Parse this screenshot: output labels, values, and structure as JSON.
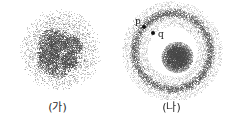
{
  "figure": {
    "width": 229,
    "height": 131,
    "background_color": "#ffffff",
    "ink_color": "#555555",
    "panels": [
      {
        "id": "panel-a",
        "caption": "(가)",
        "description": "uniform stippled disc with irregular dense core",
        "markers": []
      },
      {
        "id": "panel-b",
        "caption": "(나)",
        "description": "stippled annulus ring with dense central blob",
        "markers": [
          {
            "label": "p",
            "x": 144,
            "y": 27
          },
          {
            "label": "q",
            "x": 153,
            "y": 33
          }
        ]
      }
    ]
  },
  "chart_data": {
    "type": "scatter",
    "title": "",
    "xlabel": "",
    "ylabel": "",
    "grid": false,
    "legend": null,
    "panels": [
      {
        "name": "(가)",
        "shape": "disc",
        "center": [
          60,
          50
        ],
        "outer_radius": 42,
        "core_center": [
          59,
          52
        ],
        "core_radius": 20,
        "point_count": 5200,
        "density_profile": "dense irregular core fading to sparse halo",
        "marker_points": []
      },
      {
        "name": "(나)",
        "shape": "annulus-with-core",
        "center": [
          58,
          51
        ],
        "ring_outer_radius": 45,
        "ring_inner_radius": 31,
        "ring_peak_radius": 38,
        "core_center": [
          63,
          57
        ],
        "core_radius": 16,
        "point_count": 5600,
        "density_profile": "bright ring shell plus compact central blob, empty gap between",
        "marker_points": [
          {
            "label": "p",
            "panel_x": 30,
            "panel_y": 27,
            "on": "ring"
          },
          {
            "label": "q",
            "panel_x": 39,
            "panel_y": 33,
            "on": "inside-gap"
          }
        ]
      }
    ]
  }
}
